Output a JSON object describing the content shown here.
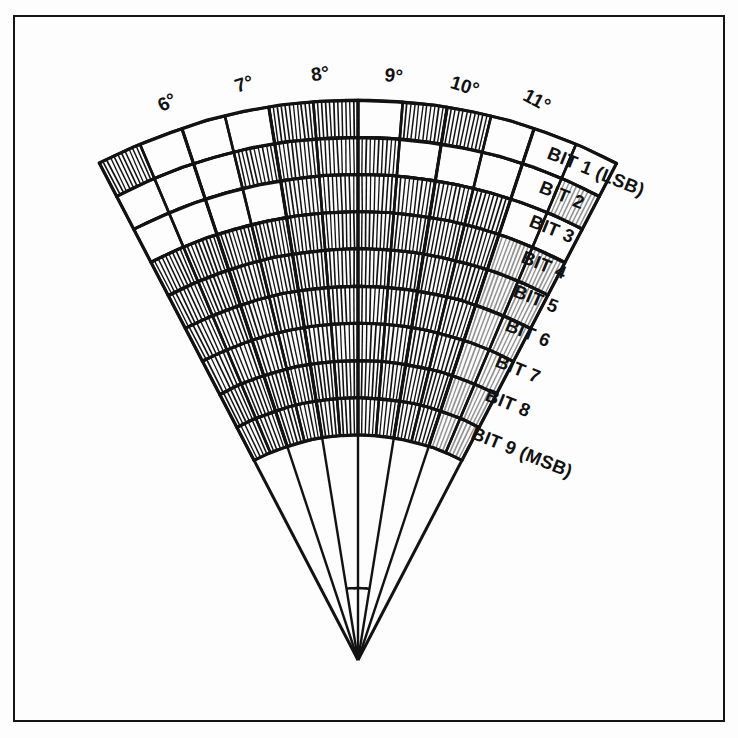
{
  "figure": {
    "kind": "gray-code-encoder-disc-sector",
    "background_color": "#fdfdfd",
    "ink_color": "#121212",
    "frame": {
      "x": 13,
      "y": 15,
      "width": 712,
      "height": 707,
      "stroke_width": 2.5,
      "stroke_color": "#151515"
    }
  },
  "geometry": {
    "apex_x": 358,
    "apex_y": 660,
    "start_angle_deg": 5.5,
    "end_angle_deg": 11.5,
    "angle_span_deg": 6,
    "inner_stub_radius": 72,
    "track_inner_radius": 225,
    "track_outer_radius": 560,
    "sweep_left_deg": -27.5,
    "sweep_right_deg": 27.5,
    "degree_count": 6
  },
  "axis": {
    "label": "Angular position (degrees)",
    "tick_labels": [
      "6°",
      "7°",
      "8°",
      "9°",
      "10°",
      "11°"
    ],
    "tick_values": [
      6,
      7,
      8,
      9,
      10,
      11
    ],
    "label_positions": [
      {
        "text": "6°",
        "x": 170,
        "y": 108,
        "rotate": -28
      },
      {
        "text": "7°",
        "x": 246,
        "y": 90,
        "rotate": -18
      },
      {
        "text": "8°",
        "x": 321,
        "y": 80,
        "rotate": -8
      },
      {
        "text": "9°",
        "x": 393,
        "y": 82,
        "rotate": 6
      },
      {
        "text": "10°",
        "x": 463,
        "y": 92,
        "rotate": 17
      },
      {
        "text": "11°",
        "x": 534,
        "y": 106,
        "rotate": 28
      }
    ]
  },
  "tracks": [
    {
      "name": "BIT 1 (LSB)",
      "short": "BIT 1",
      "suffix": "(LSB)",
      "index": 1,
      "significance": "lsb",
      "cells_per_degree": 2,
      "label": {
        "x": 546,
        "y": 158,
        "rotate": 22
      },
      "pattern": [
        1,
        0,
        0,
        0,
        1,
        1,
        0,
        1,
        1,
        0,
        0,
        0
      ]
    },
    {
      "name": "BIT 2",
      "short": "BIT 2",
      "suffix": "",
      "index": 2,
      "significance": "",
      "cells_per_degree": 2,
      "label": {
        "x": 538,
        "y": 192,
        "rotate": 22
      },
      "pattern": [
        0,
        0,
        0,
        1,
        1,
        1,
        1,
        0,
        0,
        0,
        0,
        1
      ]
    },
    {
      "name": "BIT 3",
      "short": "BIT 3",
      "suffix": "",
      "index": 3,
      "significance": "",
      "cells_per_degree": 2,
      "label": {
        "x": 528,
        "y": 226,
        "rotate": 22
      },
      "pattern": [
        0,
        0,
        0,
        0,
        1,
        1,
        1,
        1,
        1,
        1,
        0,
        0
      ]
    },
    {
      "name": "BIT 4",
      "short": "BIT 4",
      "suffix": "",
      "index": 4,
      "significance": "",
      "cells_per_degree": 2,
      "label": {
        "x": 520,
        "y": 262,
        "rotate": 22
      },
      "pattern": [
        1,
        1,
        1,
        1,
        1,
        1,
        1,
        1,
        1,
        1,
        1,
        1
      ]
    },
    {
      "name": "BIT 5",
      "short": "BIT 5",
      "suffix": "",
      "index": 5,
      "significance": "",
      "cells_per_degree": 2,
      "label": {
        "x": 512,
        "y": 296,
        "rotate": 22
      },
      "pattern": [
        1,
        1,
        1,
        1,
        1,
        1,
        1,
        1,
        1,
        1,
        1,
        1
      ]
    },
    {
      "name": "BIT 6",
      "short": "BIT 6",
      "suffix": "",
      "index": 6,
      "significance": "",
      "cells_per_degree": 2,
      "label": {
        "x": 504,
        "y": 330,
        "rotate": 22
      },
      "pattern": [
        1,
        1,
        1,
        1,
        1,
        1,
        1,
        1,
        1,
        1,
        1,
        1
      ]
    },
    {
      "name": "BIT 7",
      "short": "BIT 7",
      "suffix": "",
      "index": 7,
      "significance": "",
      "cells_per_degree": 2,
      "label": {
        "x": 494,
        "y": 366,
        "rotate": 22
      },
      "pattern": [
        1,
        1,
        1,
        1,
        1,
        1,
        1,
        1,
        1,
        1,
        1,
        1
      ]
    },
    {
      "name": "BIT 8",
      "short": "BIT 8",
      "suffix": "",
      "index": 8,
      "significance": "",
      "cells_per_degree": 2,
      "label": {
        "x": 484,
        "y": 400,
        "rotate": 22
      },
      "pattern": [
        1,
        1,
        1,
        1,
        1,
        1,
        1,
        1,
        1,
        1,
        1,
        1
      ]
    },
    {
      "name": "BIT 9 (MSB)",
      "short": "BIT 9",
      "suffix": "(MSB)",
      "index": 9,
      "significance": "msb",
      "cells_per_degree": 2,
      "label": {
        "x": 470,
        "y": 438,
        "rotate": 22
      },
      "pattern": [
        1,
        1,
        1,
        1,
        1,
        1,
        1,
        1,
        1,
        1,
        1,
        1
      ]
    }
  ],
  "style": {
    "hatch_spacing": 4.0,
    "hatch_stroke": 1.5,
    "cell_stroke": 2.6,
    "ring_stroke": 3.2,
    "spoke_stroke": 2.4,
    "faded_sector_index": 5,
    "faded_opacity": 0.45
  }
}
